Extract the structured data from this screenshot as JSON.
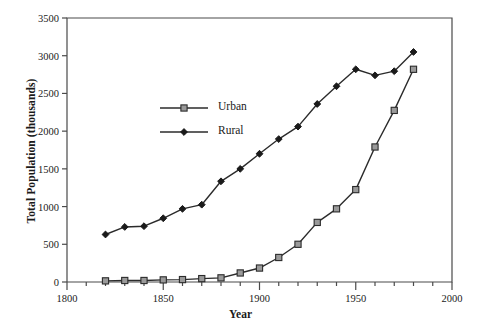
{
  "chart_data": {
    "type": "line",
    "title": "",
    "xlabel": "Year",
    "ylabel": "Total Population (thousands)",
    "xlim": [
      1800,
      2000
    ],
    "ylim": [
      0,
      3500
    ],
    "grid": false,
    "legend_position": "upper-left-inside",
    "x_major_ticks": [
      1800,
      1850,
      1900,
      1950,
      2000
    ],
    "x_major_tick_labels": [
      "1800",
      "1850",
      "1900",
      "1950",
      "2000"
    ],
    "x_minor_tick_step": 10,
    "y_ticks": [
      0,
      500,
      1000,
      1500,
      2000,
      2500,
      3000,
      3500
    ],
    "y_tick_labels": [
      "0",
      "500",
      "1000",
      "1500",
      "2000",
      "2500",
      "3000",
      "3500"
    ],
    "x": [
      1820,
      1830,
      1840,
      1850,
      1860,
      1870,
      1880,
      1890,
      1900,
      1910,
      1920,
      1930,
      1940,
      1950,
      1960,
      1970,
      1980
    ],
    "series": [
      {
        "name": "Urban",
        "marker": "open-square",
        "color": "#2b2b2b",
        "marker_fill": "#9a9a9a",
        "values": [
          15,
          20,
          20,
          28,
          32,
          45,
          55,
          120,
          185,
          325,
          500,
          790,
          970,
          1225,
          1790,
          2275,
          2820
        ]
      },
      {
        "name": "Rural",
        "marker": "filled-diamond",
        "color": "#2b2b2b",
        "marker_fill": "#1a1a1a",
        "values": [
          630,
          730,
          740,
          845,
          970,
          1025,
          1335,
          1500,
          1700,
          1895,
          2060,
          2360,
          2595,
          2820,
          2740,
          2795,
          3050
        ]
      }
    ],
    "legend": [
      {
        "label": "Urban",
        "marker": "open-square"
      },
      {
        "label": "Rural",
        "marker": "filled-diamond"
      }
    ]
  }
}
